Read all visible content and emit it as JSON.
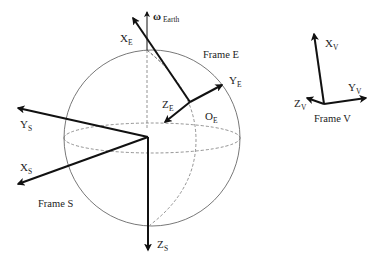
{
  "diagram": {
    "type": "coordinate-frames",
    "frames": {
      "earth": {
        "title": "Frame E",
        "origin_label": "O",
        "origin_sub": "E",
        "axes": [
          {
            "label": "X",
            "sub": "E"
          },
          {
            "label": "Y",
            "sub": "E"
          },
          {
            "label": "Z",
            "sub": "E"
          }
        ]
      },
      "sphere": {
        "title": "Frame S",
        "axes": [
          {
            "label": "X",
            "sub": "S"
          },
          {
            "label": "Y",
            "sub": "S"
          },
          {
            "label": "Z",
            "sub": "S"
          }
        ]
      },
      "vehicle": {
        "title": "Frame V",
        "axes": [
          {
            "label": "X",
            "sub": "V"
          },
          {
            "label": "Y",
            "sub": "V"
          },
          {
            "label": "Z",
            "sub": "V"
          }
        ]
      }
    },
    "rotation": {
      "symbol": "ω",
      "sub": "Earth"
    }
  }
}
